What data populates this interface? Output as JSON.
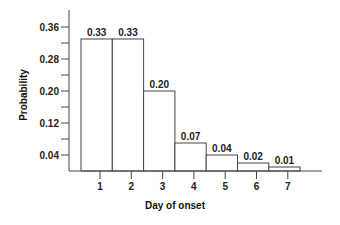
{
  "chart_data": {
    "type": "bar",
    "title": "",
    "xlabel": "Day of onset",
    "ylabel": "Probability",
    "categories": [
      "1",
      "2",
      "3",
      "4",
      "5",
      "6",
      "7"
    ],
    "values": [
      0.33,
      0.33,
      0.2,
      0.07,
      0.04,
      0.02,
      0.01
    ],
    "data_labels": [
      "0.33",
      "0.33",
      "0.20",
      "0.07",
      "0.04",
      "0.02",
      "0.01"
    ],
    "ylim": [
      0,
      0.4
    ],
    "y_ticks_labeled": [
      0.04,
      0.12,
      0.2,
      0.28,
      0.36
    ],
    "y_tick_labels": [
      "0.04",
      "0.12",
      "0.20",
      "0.28",
      "0.36"
    ],
    "y_ticks_minor": [
      0.08,
      0.16,
      0.24,
      0.32
    ],
    "grid": false,
    "legend": "none"
  }
}
